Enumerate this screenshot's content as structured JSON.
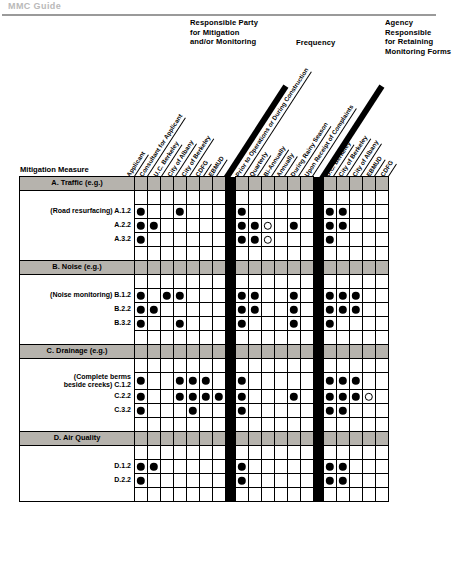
{
  "page": {
    "running_head": "MMC Guide"
  },
  "group_captions": {
    "party": "Responsible Party\nfor Mitigation\nand/or Monitoring",
    "frequency": "Frequency",
    "agency": "Agency Responsible\nfor Retaining\nMonitoring Forms"
  },
  "row_header_title": "Mitigation Measure",
  "column_groups": [
    {
      "name": "responsible-party",
      "columns": [
        "Applicant",
        "Consultant for Applicant",
        "U.C. Berkeley",
        "City of Albany",
        "City of Berkeley",
        "CDFG",
        "EBMUD"
      ]
    },
    {
      "name": "frequency",
      "columns": [
        "Prior to Operations or During Construction",
        "Quarterly",
        "Bi-Annually",
        "Annually",
        "During Rainy Season",
        "Upon Receipt of Complaints"
      ]
    },
    {
      "name": "agency-responsible",
      "columns": [
        "U.C. Berkeley",
        "City of Berkeley",
        "City of Albany",
        "EBMUD",
        "CDFG"
      ]
    }
  ],
  "legend": {
    "filled_marker": "filled-circle",
    "open_marker": "open-circle"
  },
  "colors": {
    "section_band": "#b6b3ad",
    "grid_line": "#000000",
    "separator_bar": "#000000",
    "marker_fill": "#000000",
    "page_background": "#ffffff"
  },
  "rows": [
    {
      "type": "section",
      "label": "A. Traffic (e.g.)",
      "name": "section-traffic"
    },
    {
      "type": "spacer",
      "label": "",
      "name": "spacer-a-top"
    },
    {
      "type": "measure",
      "label": "(Road resurfacing) A.1.2",
      "name": "row-a-1-2",
      "party": [
        "filled",
        "",
        "",
        "filled",
        "",
        "",
        ""
      ],
      "frequency": [
        "filled",
        "",
        "",
        "",
        "",
        ""
      ],
      "agency": [
        "filled",
        "filled",
        "",
        "",
        ""
      ]
    },
    {
      "type": "measure",
      "label": "A.2.2",
      "name": "row-a-2-2",
      "party": [
        "filled",
        "filled",
        "",
        "",
        "",
        "",
        ""
      ],
      "frequency": [
        "filled",
        "filled",
        "open",
        "",
        "filled",
        ""
      ],
      "agency": [
        "filled",
        "filled",
        "",
        "",
        ""
      ]
    },
    {
      "type": "measure",
      "label": "A.3.2",
      "name": "row-a-3-2",
      "party": [
        "filled",
        "",
        "",
        "",
        "",
        "",
        ""
      ],
      "frequency": [
        "filled",
        "filled",
        "open",
        "",
        "",
        ""
      ],
      "agency": [
        "filled",
        "",
        "",
        "",
        ""
      ]
    },
    {
      "type": "spacer",
      "label": "",
      "name": "spacer-a-bottom"
    },
    {
      "type": "section",
      "label": "B. Noise (e.g.)",
      "name": "section-noise"
    },
    {
      "type": "spacer",
      "label": "",
      "name": "spacer-b-top"
    },
    {
      "type": "measure",
      "label": "(Noise monitoring) B.1.2",
      "name": "row-b-1-2",
      "party": [
        "filled",
        "",
        "filled",
        "filled",
        "",
        "",
        ""
      ],
      "frequency": [
        "filled",
        "filled",
        "",
        "",
        "filled",
        ""
      ],
      "agency": [
        "filled",
        "filled",
        "filled",
        "",
        ""
      ]
    },
    {
      "type": "measure",
      "label": "B.2.2",
      "name": "row-b-2-2",
      "party": [
        "filled",
        "filled",
        "",
        "",
        "",
        "",
        ""
      ],
      "frequency": [
        "filled",
        "filled",
        "",
        "",
        "filled",
        ""
      ],
      "agency": [
        "filled",
        "filled",
        "filled",
        "",
        ""
      ]
    },
    {
      "type": "measure",
      "label": "B.3.2",
      "name": "row-b-3-2",
      "party": [
        "filled",
        "",
        "",
        "filled",
        "",
        "",
        ""
      ],
      "frequency": [
        "filled",
        "",
        "",
        "",
        "filled",
        ""
      ],
      "agency": [
        "filled",
        "",
        "",
        "",
        ""
      ]
    },
    {
      "type": "spacer",
      "label": "",
      "name": "spacer-b-bottom"
    },
    {
      "type": "section",
      "label": "C. Drainage (e.g.)",
      "name": "section-drainage"
    },
    {
      "type": "spacer",
      "label": "",
      "name": "spacer-c-top"
    },
    {
      "type": "measure",
      "label": "(Complete berms\n beside creeks)        C.1.2",
      "name": "row-c-1-2",
      "party": [
        "filled",
        "",
        "",
        "filled",
        "filled",
        "filled",
        ""
      ],
      "frequency": [
        "filled",
        "",
        "",
        "",
        "",
        ""
      ],
      "agency": [
        "filled",
        "filled",
        "filled",
        "",
        ""
      ]
    },
    {
      "type": "measure",
      "label": "C.2.2",
      "name": "row-c-2-2",
      "party": [
        "filled",
        "",
        "",
        "filled",
        "filled",
        "filled",
        "filled"
      ],
      "frequency": [
        "filled",
        "",
        "",
        "",
        "filled",
        ""
      ],
      "agency": [
        "filled",
        "filled",
        "filled",
        "open",
        ""
      ]
    },
    {
      "type": "measure",
      "label": "C.3.2",
      "name": "row-c-3-2",
      "party": [
        "filled",
        "",
        "",
        "",
        "filled",
        "",
        ""
      ],
      "frequency": [
        "filled",
        "",
        "",
        "",
        "",
        ""
      ],
      "agency": [
        "filled",
        "filled",
        "",
        "",
        ""
      ]
    },
    {
      "type": "spacer",
      "label": "",
      "name": "spacer-c-bottom"
    },
    {
      "type": "section",
      "label": "D. Air Quality",
      "name": "section-air-quality"
    },
    {
      "type": "spacer",
      "label": "",
      "name": "spacer-d-top"
    },
    {
      "type": "measure",
      "label": "D.1.2",
      "name": "row-d-1-2",
      "party": [
        "filled",
        "filled",
        "",
        "",
        "",
        "",
        ""
      ],
      "frequency": [
        "filled",
        "",
        "",
        "",
        "",
        ""
      ],
      "agency": [
        "filled",
        "filled",
        "",
        "",
        ""
      ]
    },
    {
      "type": "measure",
      "label": "D.2.2",
      "name": "row-d-2-2",
      "party": [
        "filled",
        "",
        "",
        "",
        "",
        "",
        ""
      ],
      "frequency": [
        "filled",
        "",
        "",
        "",
        "",
        ""
      ],
      "agency": [
        "filled",
        "filled",
        "",
        "",
        ""
      ]
    },
    {
      "type": "spacer",
      "label": "",
      "name": "spacer-d-bottom"
    }
  ]
}
